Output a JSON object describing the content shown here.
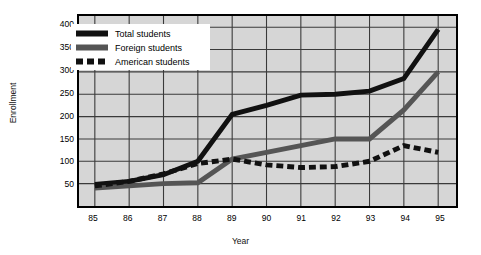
{
  "chart_data": {
    "type": "line",
    "title": "",
    "xlabel": "Year",
    "ylabel": "Enrollment",
    "x": [
      "85",
      "86",
      "87",
      "88",
      "89",
      "90",
      "91",
      "92",
      "93",
      "94",
      "95"
    ],
    "xticks": [
      "85",
      "86",
      "87",
      "88",
      "89",
      "90",
      "91",
      "92",
      "93",
      "94",
      "95"
    ],
    "yticks": [
      "50",
      "100",
      "150",
      "200",
      "250",
      "300",
      "350",
      "400"
    ],
    "ylim": [
      0,
      425
    ],
    "xlim": [
      84.5,
      95.5
    ],
    "grid": true,
    "legend_position": "upper-left-inside",
    "series": [
      {
        "name": "Total students",
        "style": "solid",
        "color": "#111111",
        "width": 5,
        "values": [
          48,
          55,
          70,
          100,
          205,
          225,
          248,
          250,
          257,
          285,
          395
        ]
      },
      {
        "name": "Foreign students",
        "style": "solid",
        "color": "#555555",
        "width": 5,
        "values": [
          40,
          45,
          50,
          52,
          105,
          120,
          135,
          150,
          150,
          215,
          300
        ]
      },
      {
        "name": "American students",
        "style": "dashed",
        "color": "#111111",
        "width": 5,
        "values": [
          45,
          55,
          72,
          95,
          105,
          92,
          86,
          88,
          100,
          135,
          120
        ]
      }
    ]
  },
  "legend": {
    "items": [
      {
        "label": "Total students",
        "swatch": "solid-black"
      },
      {
        "label": "Foreign students",
        "swatch": "solid-gray"
      },
      {
        "label": "American students",
        "swatch": "dashed-black"
      }
    ]
  },
  "colors": {
    "plot_background": "#d6d6d6",
    "page_background": "#ffffff",
    "frame": "#000000",
    "grid": "#3a3a3a",
    "total": "#111111",
    "foreign": "#555555",
    "american": "#111111"
  }
}
